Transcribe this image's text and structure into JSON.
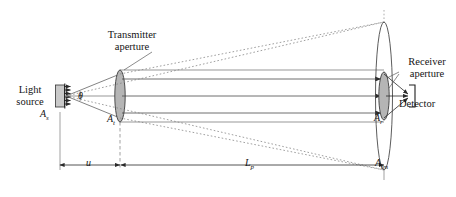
{
  "figure": {
    "type": "optical-link-schematic",
    "title": "",
    "background_color": "#ffffff",
    "line_color": "#3c3c3c",
    "lens_fill_color": "#b5b5b5",
    "text_color": "#141414"
  },
  "labels": {
    "light_source_line1": "Light",
    "light_source_line2": "source",
    "transmitter_line1": "Transmitter",
    "transmitter_line2": "aperture",
    "receiver_line1": "Receiver",
    "receiver_line2": "aperture",
    "detector": "Detector",
    "theta": "θ"
  },
  "areas": {
    "source_area": "A",
    "source_area_sub": "s",
    "transmitter_area": "A",
    "transmitter_area_sub": "t",
    "receiver_area": "A",
    "receiver_area_sub": "r",
    "image_area": "A",
    "image_area_sub": "im"
  },
  "dimensions": {
    "u_symbol": "u",
    "lp_symbol": "L",
    "lp_subscript": "p"
  },
  "components": [
    {
      "name": "light-source",
      "shape": "rectangle-with-emission-arrows"
    },
    {
      "name": "transmitter-aperture",
      "shape": "lens-ellipse-filled"
    },
    {
      "name": "receiver-aperture",
      "shape": "large-lens-ellipse"
    },
    {
      "name": "receiver-inner-lens",
      "shape": "lens-ellipse-filled"
    },
    {
      "name": "detector",
      "shape": "bracket"
    }
  ],
  "beams": {
    "divergent_ray_count": 2,
    "collimated_ray_count": 3,
    "converging_ray_count": 3,
    "projection_style": "dotted"
  }
}
